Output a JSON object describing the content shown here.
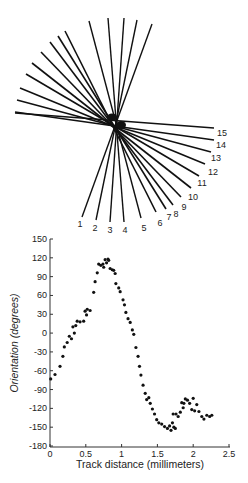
{
  "chart_data": [
    {
      "type": "diagram",
      "title": "",
      "description": "Fan of 15 numbered orientation lines crossing a common center",
      "center": [
        117,
        121
      ],
      "lines": [
        {
          "label": "1",
          "upper": [
            152,
            24
          ],
          "lower": [
            82,
            217
          ],
          "label_pos": [
            80,
            227
          ]
        },
        {
          "label": "2",
          "upper": [
            137,
            20
          ],
          "lower": [
            96,
            220
          ],
          "label_pos": [
            95,
            231
          ]
        },
        {
          "label": "3",
          "upper": [
            124,
            18
          ],
          "lower": [
            110,
            222
          ],
          "label_pos": [
            110,
            233
          ]
        },
        {
          "label": "4",
          "upper": [
            108,
            18
          ],
          "lower": [
            124,
            222
          ],
          "label_pos": [
            125,
            233
          ]
        },
        {
          "label": "5",
          "upper": [
            89,
            21
          ],
          "lower": [
            141,
            218
          ],
          "label_pos": [
            144,
            231
          ]
        },
        {
          "label": "6",
          "upper": [
            65,
            31
          ],
          "lower": [
            156,
            212
          ],
          "label_pos": [
            160,
            226
          ]
        },
        {
          "label": "7",
          "upper": [
            58,
            36
          ],
          "lower": [
            166,
            209
          ],
          "label_pos": [
            169,
            220
          ]
        },
        {
          "label": "8",
          "upper": [
            50,
            42
          ],
          "lower": [
            173,
            205
          ],
          "label_pos": [
            176,
            217
          ]
        },
        {
          "label": "9",
          "upper": [
            41,
            52
          ],
          "lower": [
            181,
            197
          ],
          "label_pos": [
            184,
            210
          ]
        },
        {
          "label": "10",
          "upper": [
            32,
            63
          ],
          "lower": [
            191,
            188
          ],
          "label_pos": [
            193,
            200
          ]
        },
        {
          "label": "11",
          "upper": [
            26,
            74
          ],
          "lower": [
            199,
            176
          ],
          "label_pos": [
            202,
            186
          ]
        },
        {
          "label": "12",
          "upper": [
            20,
            88
          ],
          "lower": [
            205,
            164
          ],
          "label_pos": [
            213,
            175
          ]
        },
        {
          "label": "13",
          "upper": [
            17,
            100
          ],
          "lower": [
            211,
            152
          ],
          "label_pos": [
            216,
            161
          ]
        },
        {
          "label": "14",
          "upper": [
            15,
            112
          ],
          "lower": [
            214,
            140
          ],
          "label_pos": [
            221,
            148
          ]
        },
        {
          "label": "15",
          "upper": [
            15,
            113
          ],
          "lower": [
            214,
            128
          ],
          "label_pos": [
            222,
            136
          ]
        }
      ]
    },
    {
      "type": "scatter",
      "title": "",
      "xlabel": "Track distance (millimeters)",
      "ylabel": "Orientation (degrees)",
      "xlim": [
        0,
        2.5
      ],
      "ylim": [
        -180,
        150
      ],
      "xticks": [
        "0",
        "0.5",
        "1",
        "1.5",
        "2",
        "2.5"
      ],
      "yticks": [
        "150",
        "120",
        "90",
        "60",
        "30",
        "0",
        "-30",
        "-60",
        "-90",
        "-120",
        "-150",
        "-180"
      ],
      "grid": false,
      "legend": null,
      "x": [
        0.01,
        0.07,
        0.14,
        0.18,
        0.2,
        0.24,
        0.27,
        0.3,
        0.32,
        0.34,
        0.36,
        0.38,
        0.42,
        0.47,
        0.49,
        0.52,
        0.51,
        0.56,
        0.61,
        0.63,
        0.66,
        0.68,
        0.71,
        0.74,
        0.75,
        0.77,
        0.79,
        0.81,
        0.82,
        0.84,
        0.87,
        0.89,
        0.91,
        0.92,
        0.96,
        0.98,
        1.02,
        1.04,
        1.06,
        1.09,
        1.12,
        1.15,
        1.17,
        1.2,
        1.23,
        1.25,
        1.27,
        1.3,
        1.33,
        1.35,
        1.38,
        1.4,
        1.43,
        1.46,
        1.49,
        1.52,
        1.56,
        1.6,
        1.64,
        1.67,
        1.69,
        1.71,
        1.72,
        1.73,
        1.75,
        1.76,
        1.79,
        1.82,
        1.84,
        1.86,
        1.87,
        1.89,
        1.92,
        1.95,
        1.98,
        2.0,
        2.02,
        2.05,
        2.08,
        2.12,
        2.15,
        2.19,
        2.23,
        2.26
      ],
      "y": [
        -73,
        -66,
        -53,
        -37,
        -22,
        -15,
        -5,
        -9,
        10,
        0,
        12,
        19,
        18,
        19,
        35,
        38,
        29,
        36,
        65,
        82,
        96,
        110,
        108,
        110,
        105,
        117,
        112,
        118,
        116,
        103,
        101,
        100,
        95,
        79,
        72,
        66,
        53,
        45,
        33,
        23,
        17,
        5,
        -2,
        -23,
        -37,
        -53,
        -67,
        -83,
        -96,
        -106,
        -103,
        -112,
        -121,
        -129,
        -138,
        -143,
        -145,
        -149,
        -152,
        -148,
        -155,
        -143,
        -129,
        -150,
        -152,
        -129,
        -133,
        -126,
        -111,
        -119,
        -112,
        -105,
        -107,
        -112,
        -122,
        -104,
        -124,
        -114,
        -125,
        -133,
        -137,
        -131,
        -133,
        -131
      ]
    }
  ],
  "figure": {
    "plot_area": {
      "left": 50,
      "right": 229,
      "top": 239,
      "bottom": 446
    },
    "x_axis_title": "Track distance (millimeters)",
    "y_axis_title": "Orientation (degrees)",
    "point_color": "#111111",
    "line_color": "#111111"
  }
}
